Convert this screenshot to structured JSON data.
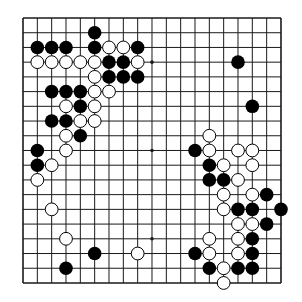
{
  "board": {
    "size": 19,
    "origin_x": 23,
    "origin_y": 18,
    "spacing_x": 14.333,
    "spacing_y": 14.72,
    "line_color": "#1a1a1a",
    "background": "#ffffff",
    "black_color": "#000000",
    "white_fill": "#ffffff",
    "white_stroke": "#000000",
    "stone_radius": 6.8,
    "star_points": [
      [
        9,
        3
      ],
      [
        9,
        9
      ],
      [
        9,
        15
      ]
    ]
  },
  "stones": {
    "black": [
      [
        5,
        1
      ],
      [
        1,
        2
      ],
      [
        2,
        2
      ],
      [
        3,
        2
      ],
      [
        5,
        2
      ],
      [
        8,
        2
      ],
      [
        6,
        3
      ],
      [
        7,
        3
      ],
      [
        15,
        3
      ],
      [
        6,
        4
      ],
      [
        7,
        4
      ],
      [
        8,
        4
      ],
      [
        2,
        5
      ],
      [
        3,
        5
      ],
      [
        4,
        5
      ],
      [
        4,
        6
      ],
      [
        16,
        6
      ],
      [
        2,
        7
      ],
      [
        3,
        7
      ],
      [
        4,
        8
      ],
      [
        1,
        9
      ],
      [
        12,
        9
      ],
      [
        1,
        10
      ],
      [
        13,
        10
      ],
      [
        13,
        11
      ],
      [
        14,
        11
      ],
      [
        17,
        12
      ],
      [
        15,
        13
      ],
      [
        16,
        13
      ],
      [
        18,
        13
      ],
      [
        17,
        14
      ],
      [
        16,
        15
      ],
      [
        5,
        16
      ],
      [
        12,
        16
      ],
      [
        16,
        16
      ],
      [
        3,
        17
      ],
      [
        13,
        17
      ],
      [
        15,
        17
      ],
      [
        16,
        17
      ]
    ],
    "white": [
      [
        6,
        2
      ],
      [
        7,
        2
      ],
      [
        1,
        3
      ],
      [
        2,
        3
      ],
      [
        3,
        3
      ],
      [
        4,
        3
      ],
      [
        5,
        3
      ],
      [
        8,
        3
      ],
      [
        5,
        4
      ],
      [
        5,
        5
      ],
      [
        6,
        5
      ],
      [
        3,
        6
      ],
      [
        5,
        6
      ],
      [
        4,
        7
      ],
      [
        5,
        7
      ],
      [
        3,
        8
      ],
      [
        13,
        8
      ],
      [
        3,
        9
      ],
      [
        13,
        9
      ],
      [
        15,
        9
      ],
      [
        16,
        9
      ],
      [
        2,
        10
      ],
      [
        14,
        10
      ],
      [
        16,
        10
      ],
      [
        1,
        11
      ],
      [
        15,
        11
      ],
      [
        14,
        12
      ],
      [
        16,
        12
      ],
      [
        2,
        13
      ],
      [
        14,
        13
      ],
      [
        15,
        14
      ],
      [
        16,
        14
      ],
      [
        3,
        15
      ],
      [
        13,
        15
      ],
      [
        15,
        15
      ],
      [
        8,
        16
      ],
      [
        13,
        16
      ],
      [
        15,
        16
      ],
      [
        14,
        17
      ],
      [
        14,
        18
      ]
    ]
  }
}
